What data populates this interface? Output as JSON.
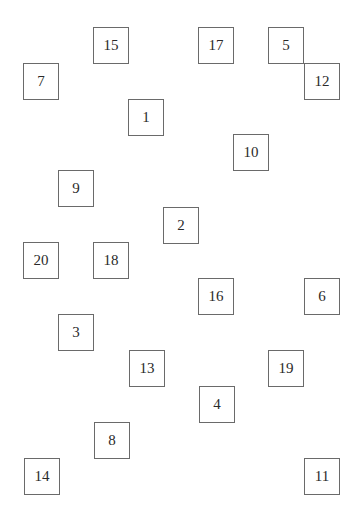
{
  "diagram": {
    "type": "grid-of-numbered-boxes",
    "cell_size_px": 35,
    "boxes": [
      {
        "label": "15",
        "x": 93,
        "y": 27
      },
      {
        "label": "17",
        "x": 198,
        "y": 27
      },
      {
        "label": "5",
        "x": 268,
        "y": 27
      },
      {
        "label": "7",
        "x": 23,
        "y": 63
      },
      {
        "label": "12",
        "x": 304,
        "y": 63
      },
      {
        "label": "1",
        "x": 128,
        "y": 99
      },
      {
        "label": "10",
        "x": 233,
        "y": 134
      },
      {
        "label": "9",
        "x": 58,
        "y": 170
      },
      {
        "label": "2",
        "x": 163,
        "y": 207
      },
      {
        "label": "20",
        "x": 23,
        "y": 242
      },
      {
        "label": "18",
        "x": 93,
        "y": 242
      },
      {
        "label": "16",
        "x": 198,
        "y": 278
      },
      {
        "label": "6",
        "x": 304,
        "y": 278
      },
      {
        "label": "3",
        "x": 58,
        "y": 314
      },
      {
        "label": "13",
        "x": 129,
        "y": 350
      },
      {
        "label": "19",
        "x": 268,
        "y": 350
      },
      {
        "label": "4",
        "x": 199,
        "y": 386
      },
      {
        "label": "8",
        "x": 94,
        "y": 422
      },
      {
        "label": "14",
        "x": 24,
        "y": 458
      },
      {
        "label": "11",
        "x": 304,
        "y": 458
      }
    ]
  }
}
